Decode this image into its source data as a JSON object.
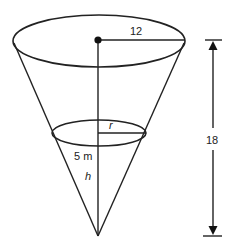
{
  "figure": {
    "labels": {
      "top_radius": "12",
      "height": "18",
      "water_radius": "r",
      "water_volume_unit": "5 m",
      "water_height": "h"
    },
    "colors": {
      "stroke": "#222222",
      "background": "#ffffff"
    }
  }
}
